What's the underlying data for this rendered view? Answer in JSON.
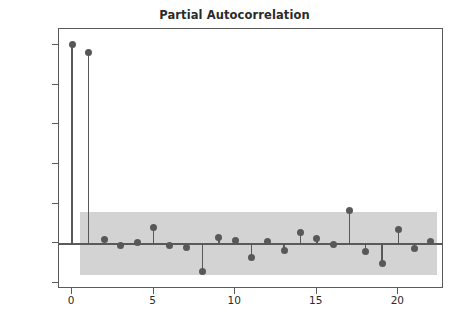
{
  "chart_data": {
    "type": "scatter",
    "title": "Partial Autocorrelation",
    "xlabel": "",
    "ylabel": "",
    "xlim": [
      -0.8,
      22.8
    ],
    "ylim": [
      -0.23,
      1.08
    ],
    "grid": false,
    "legend": null,
    "style": "stem",
    "series_name": "Partial autocorrelation (PACF)",
    "x": [
      0,
      1,
      2,
      3,
      4,
      5,
      6,
      7,
      8,
      9,
      10,
      11,
      12,
      13,
      14,
      15,
      16,
      17,
      18,
      19,
      20,
      21,
      22
    ],
    "values": [
      1.0,
      0.96,
      0.02,
      -0.012,
      0.003,
      0.082,
      -0.01,
      -0.022,
      -0.141,
      0.028,
      0.012,
      -0.072,
      0.011,
      -0.036,
      0.057,
      0.022,
      -0.008,
      0.168,
      -0.041,
      -0.101,
      0.068,
      -0.027,
      0.007
    ],
    "xticks": [
      0,
      5,
      10,
      15,
      20
    ],
    "xticklabels": [
      "0",
      "5",
      "10",
      "15",
      "20"
    ],
    "yticks": [
      -0.2,
      0.0,
      0.2,
      0.4,
      0.6,
      0.8,
      1.0
    ],
    "yticklabels": [
      "−0.2",
      "0.0",
      "0.2",
      "0.4",
      "0.6",
      "0.8",
      "1.0"
    ],
    "confidence_band": {
      "label": "95% confidence interval",
      "upper": 0.16,
      "lower": -0.16,
      "start_lag": 0.5,
      "end_lag": 22.4,
      "color": "#d3d3d3"
    },
    "colors": {
      "marker": "#585858",
      "stem": "#585858",
      "zero_line": "#5a5a5a",
      "axes": "#5a5a5a",
      "background": "#ffffff",
      "title": "#2b2b2b"
    }
  }
}
